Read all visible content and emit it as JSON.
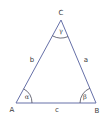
{
  "diagram": {
    "type": "triangle",
    "colors": {
      "edge": "#6670a8",
      "arc": "#4a4a5a",
      "text": "#3a3a3a",
      "background": "#ffffff"
    },
    "vertices": {
      "A": {
        "label": "A",
        "x": 16,
        "y": 103
      },
      "B": {
        "label": "B",
        "x": 96,
        "y": 103
      },
      "C": {
        "label": "C",
        "x": 61,
        "y": 20
      }
    },
    "sides": {
      "a": {
        "label": "a"
      },
      "b": {
        "label": "b"
      },
      "c": {
        "label": "c"
      }
    },
    "angles": {
      "alpha": {
        "label": "α",
        "at": "A"
      },
      "beta": {
        "label": "β",
        "at": "B"
      },
      "gamma": {
        "label": "γ",
        "at": "C"
      }
    }
  }
}
